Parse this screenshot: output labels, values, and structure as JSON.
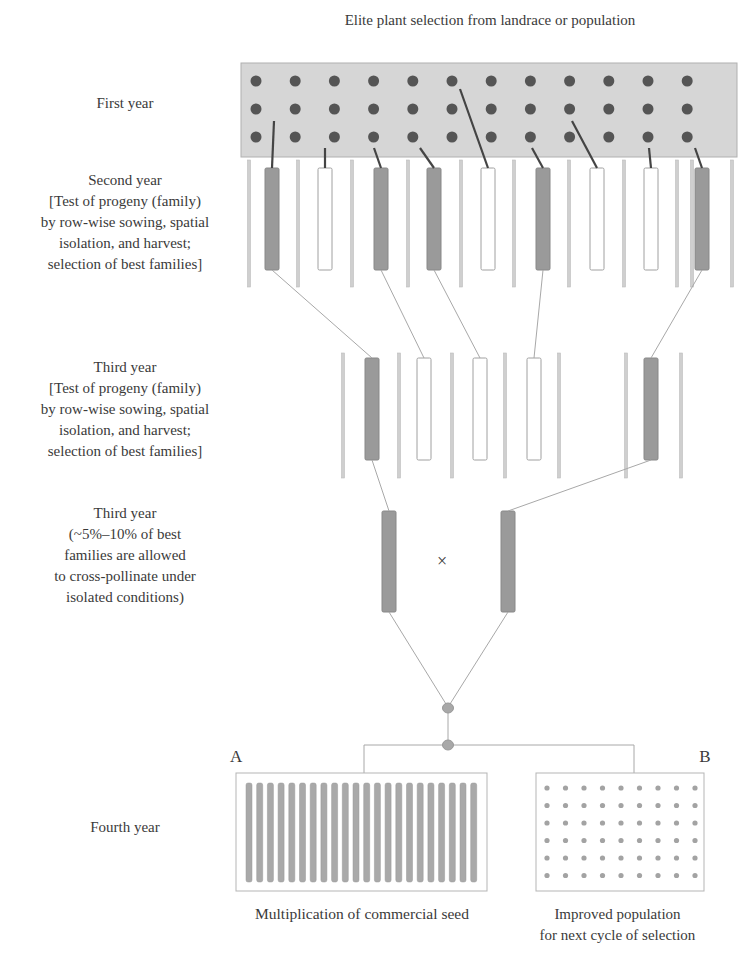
{
  "title": "Elite plant selection from landrace or population",
  "stages": [
    {
      "id": "first-year",
      "lines": [
        "First year"
      ]
    },
    {
      "id": "second-year",
      "lines": [
        "Second year",
        "[Test of progeny (family)",
        "by row-wise sowing, spatial",
        "isolation, and harvest;",
        "selection of best families]"
      ]
    },
    {
      "id": "third-year-test",
      "lines": [
        "Third year",
        "[Test of progeny (family)",
        "by row-wise sowing, spatial",
        "isolation, and harvest;",
        "selection of best families]"
      ]
    },
    {
      "id": "third-year-cross",
      "lines": [
        "Third year",
        "(~5%–10% of best",
        "families are allowed",
        "to cross-pollinate under",
        "isolated conditions)"
      ]
    },
    {
      "id": "fourth-year",
      "lines": [
        "Fourth year"
      ]
    }
  ],
  "first_year_field": {
    "rows": 3,
    "cols": 12
  },
  "second_year_plots": [
    "selected",
    "rejected",
    "selected",
    "selected",
    "rejected",
    "selected",
    "rejected",
    "rejected",
    "selected"
  ],
  "third_year_plots": [
    "selected",
    "rejected",
    "rejected",
    "rejected",
    "selected"
  ],
  "cross_symbol": "×",
  "outcome_a": {
    "letter": "A",
    "label": "Multiplication of commercial seed",
    "row_count": 22
  },
  "outcome_b": {
    "letter": "B",
    "label_lines": [
      "Improved population",
      "for next cycle of selection"
    ],
    "grid_rows": 6,
    "grid_cols": 9
  },
  "colors": {
    "selected_fill": "#9a9a9a",
    "rejected_fill": "#ffffff",
    "field_fill": "#d6d6d6",
    "dot": "#555555",
    "line": "#a8a8a8",
    "connector_dark": "#444444"
  }
}
